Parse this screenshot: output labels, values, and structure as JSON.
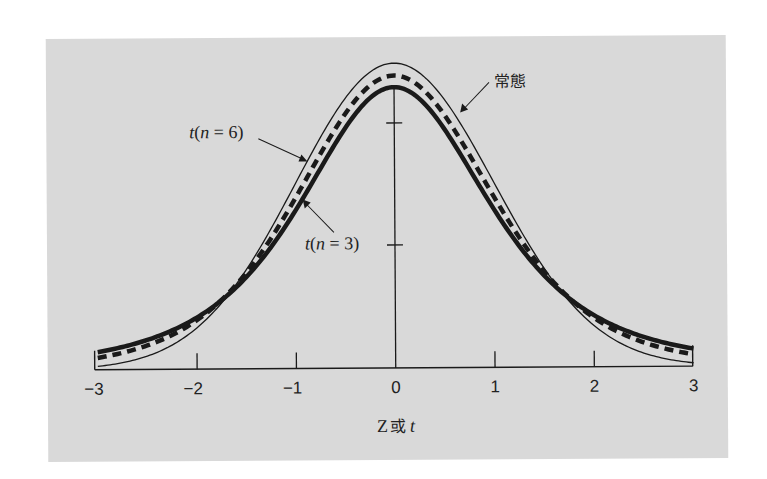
{
  "chart_data": {
    "type": "line",
    "title": "",
    "xlabel": "Z 或 t",
    "xlabel_parts": {
      "z": "Z",
      "or": "或",
      "t": "t"
    },
    "ylabel": "",
    "xlim": [
      -3,
      3
    ],
    "x_ticks": [
      -3,
      -2,
      -1,
      0,
      1,
      2,
      3
    ],
    "x_tick_labels": [
      "−3",
      "−2",
      "−1",
      "0",
      "1",
      "2",
      "3"
    ],
    "y_axis_ticks_unlabeled": 2,
    "grid": false,
    "series": [
      {
        "name": "常態",
        "distribution": "normal",
        "df": null,
        "style": "thin-solid",
        "peak": 0.399,
        "value_at_pm3": 0.004
      },
      {
        "name": "t(n = 6)",
        "distribution": "student-t",
        "df": 6,
        "style": "thick-dashed",
        "peak": 0.383,
        "value_at_pm3": 0.016
      },
      {
        "name": "t(n = 3)",
        "distribution": "student-t",
        "df": 3,
        "style": "thick-solid",
        "peak": 0.368,
        "value_at_pm3": 0.023
      }
    ],
    "annotations": [
      {
        "text": "常態",
        "points_to": "normal curve right shoulder"
      },
      {
        "text": "t(n = 6)",
        "points_to": "dashed curve left shoulder"
      },
      {
        "text": "t(n = 3)",
        "points_to": "thick curve left shoulder"
      }
    ]
  },
  "labels": {
    "normal": "常態",
    "t6_prefix": "t",
    "t6_open": "(",
    "t6_n": "n",
    "t6_rest": " = 6)",
    "t3_prefix": "t",
    "t3_open": "(",
    "t3_n": "n",
    "t3_rest": " = 3)"
  },
  "colors": {
    "panel": "#d9d9d9",
    "ink": "#1a1a1a"
  }
}
